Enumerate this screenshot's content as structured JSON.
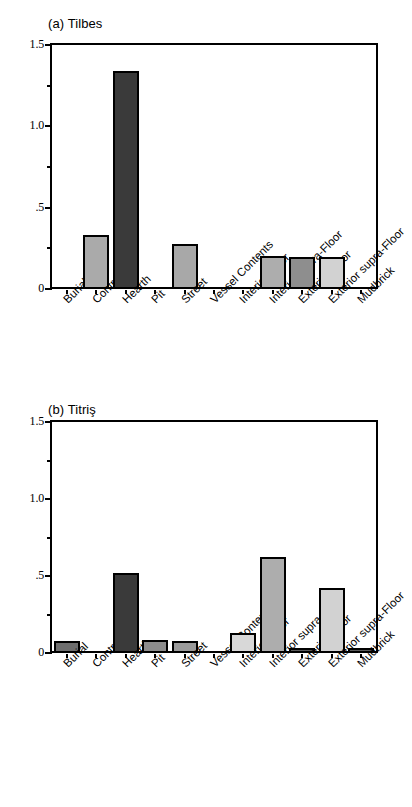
{
  "figure": {
    "background_color": "#ffffff",
    "axis_color": "#000000"
  },
  "panels": [
    {
      "id": "a",
      "title": "(a) Tilbes"
    },
    {
      "id": "b",
      "title": "(b) Titriş"
    }
  ],
  "chart_data": [
    {
      "type": "bar",
      "title": "(a) Tilbes",
      "xlabel": "",
      "ylabel": "",
      "ylim": [
        0,
        1.5
      ],
      "yticks": [
        0,
        0.5,
        1.0,
        1.5
      ],
      "ytick_labels": [
        "0",
        ".5",
        "1.0",
        "1.5"
      ],
      "yminor_ticks": [
        0.25,
        0.75,
        1.25
      ],
      "grid": false,
      "legend": false,
      "categories": [
        "Burial",
        "Control",
        "Hearth",
        "Pit",
        "Street",
        "Vessel Contents",
        "Interior Floor",
        "Interior supra-Floor",
        "Exterior Floor",
        "Exterior supra-Floor",
        "Mudbrick"
      ],
      "values": [
        0,
        0.33,
        1.34,
        0,
        0.275,
        0,
        0,
        0.2,
        0.195,
        0.195,
        0
      ],
      "bar_colors": [
        "#ffffff",
        "#aaaaaa",
        "#3a3a3a",
        "#ffffff",
        "#a8a8a8",
        "#ffffff",
        "#ffffff",
        "#adadad",
        "#8e8e8e",
        "#d2d2d2",
        "#ffffff"
      ]
    },
    {
      "type": "bar",
      "title": "(b) Titriş",
      "xlabel": "",
      "ylabel": "",
      "ylim": [
        0,
        1.5
      ],
      "yticks": [
        0,
        0.5,
        1.0,
        1.5
      ],
      "ytick_labels": [
        "0",
        ".5",
        "1.0",
        "1.5"
      ],
      "yminor_ticks": [
        0.25,
        0.75,
        1.25
      ],
      "grid": false,
      "legend": false,
      "categories": [
        "Burial",
        "Control",
        "Hearth",
        "Pit",
        "Street",
        "Vessel Contents",
        "Interior Floor",
        "Interior supra-Floor",
        "Exterior Floor",
        "Exterior supra-Floor",
        "Mudbrick"
      ],
      "values": [
        0.075,
        0,
        0.52,
        0.085,
        0.075,
        0,
        0.13,
        0.625,
        0.03,
        0.42,
        0.035
      ],
      "bar_colors": [
        "#6e6e6e",
        "#ffffff",
        "#3a3a3a",
        "#8c8c8c",
        "#9a9a9a",
        "#ffffff",
        "#d8d8d8",
        "#adadad",
        "#5a5a5a",
        "#d2d2d2",
        "#5a5a5a"
      ]
    }
  ]
}
